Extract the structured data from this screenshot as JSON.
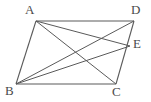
{
  "figure": {
    "kind": "parallelogram-with-diagonals",
    "background_color": "#ffffff",
    "stroke_color": "#5a5a5a",
    "label_color": "#4a4a4a",
    "stroke_width": 1,
    "canvas": {
      "width": 151,
      "height": 102
    }
  },
  "points": {
    "A": {
      "label": "A",
      "x": 36,
      "y": 21,
      "label_x": 25,
      "label_y": 3
    },
    "B": {
      "label": "B",
      "x": 16,
      "y": 84,
      "label_x": 5,
      "label_y": 84
    },
    "C": {
      "label": "C",
      "x": 116,
      "y": 84,
      "label_x": 112,
      "label_y": 85
    },
    "D": {
      "label": "D",
      "x": 134,
      "y": 21,
      "label_x": 131,
      "label_y": 3
    },
    "E": {
      "label": "E",
      "x": 130,
      "y": 46,
      "label_x": 133,
      "label_y": 37
    }
  },
  "segments": [
    {
      "name": "side-AD",
      "from": "A",
      "to": "D"
    },
    {
      "name": "side-AB",
      "from": "A",
      "to": "B"
    },
    {
      "name": "side-BC",
      "from": "B",
      "to": "C"
    },
    {
      "name": "side-DC",
      "from": "D",
      "to": "C"
    },
    {
      "name": "diagonal-AC",
      "from": "A",
      "to": "C"
    },
    {
      "name": "diagonal-BD",
      "from": "B",
      "to": "D"
    },
    {
      "name": "segment-AE",
      "from": "A",
      "to": "E"
    },
    {
      "name": "segment-BE",
      "from": "B",
      "to": "E"
    }
  ]
}
